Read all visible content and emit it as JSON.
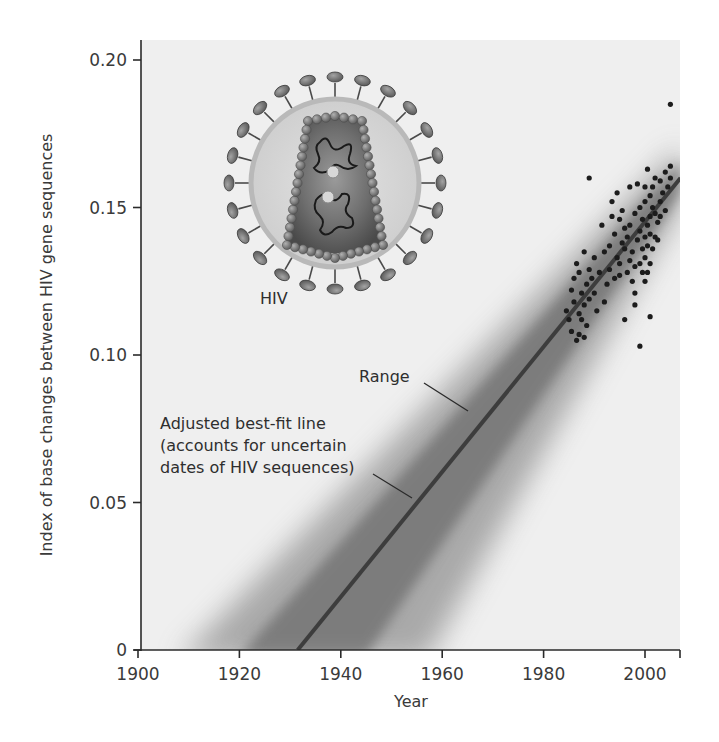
{
  "chart_data": {
    "type": "scatter",
    "title": "",
    "xlabel": "Year",
    "ylabel": "Index of base changes between HIV gene sequences",
    "xlim": [
      1900,
      2007
    ],
    "ylim": [
      0,
      0.21
    ],
    "x_ticks": [
      "1900",
      "1920",
      "1940",
      "1960",
      "1980",
      "2000"
    ],
    "y_ticks": [
      "0",
      "0.05",
      "0.10",
      "0.15",
      "0.20"
    ],
    "grid": false,
    "legend": null,
    "series": [
      {
        "name": "HIV sequences",
        "kind": "scatter",
        "color": "#1e1e1e",
        "points": [
          [
            1984.5,
            0.115
          ],
          [
            1985,
            0.112
          ],
          [
            1985.5,
            0.122
          ],
          [
            1985.5,
            0.108
          ],
          [
            1986,
            0.126
          ],
          [
            1986,
            0.118
          ],
          [
            1986.5,
            0.105
          ],
          [
            1986.5,
            0.131
          ],
          [
            1987,
            0.114
          ],
          [
            1987,
            0.107
          ],
          [
            1987,
            0.128
          ],
          [
            1987.5,
            0.121
          ],
          [
            1987.5,
            0.112
          ],
          [
            1988,
            0.117
          ],
          [
            1988,
            0.135
          ],
          [
            1988,
            0.106
          ],
          [
            1988.5,
            0.124
          ],
          [
            1988.5,
            0.11
          ],
          [
            1989,
            0.119
          ],
          [
            1989,
            0.129
          ],
          [
            1989,
            0.16
          ],
          [
            1989.5,
            0.126
          ],
          [
            1990,
            0.121
          ],
          [
            1990,
            0.133
          ],
          [
            1990.5,
            0.115
          ],
          [
            1991,
            0.128
          ],
          [
            1991.5,
            0.144
          ],
          [
            1992,
            0.118
          ],
          [
            1992,
            0.135
          ],
          [
            1992.5,
            0.124
          ],
          [
            1993,
            0.129
          ],
          [
            1993,
            0.137
          ],
          [
            1993.5,
            0.147
          ],
          [
            1993.5,
            0.152
          ],
          [
            1994,
            0.126
          ],
          [
            1994,
            0.141
          ],
          [
            1994.5,
            0.133
          ],
          [
            1994.5,
            0.155
          ],
          [
            1995,
            0.131
          ],
          [
            1995,
            0.127
          ],
          [
            1995,
            0.146
          ],
          [
            1995.5,
            0.138
          ],
          [
            1995.5,
            0.149
          ],
          [
            1996,
            0.136
          ],
          [
            1996,
            0.143
          ],
          [
            1996,
            0.112
          ],
          [
            1996.5,
            0.128
          ],
          [
            1996.5,
            0.14
          ],
          [
            1997,
            0.132
          ],
          [
            1997,
            0.144
          ],
          [
            1997,
            0.157
          ],
          [
            1997.5,
            0.125
          ],
          [
            1997.5,
            0.135
          ],
          [
            1998,
            0.13
          ],
          [
            1998,
            0.121
          ],
          [
            1998,
            0.148
          ],
          [
            1998,
            0.117
          ],
          [
            1998.5,
            0.139
          ],
          [
            1998.5,
            0.158
          ],
          [
            1999,
            0.131
          ],
          [
            1999,
            0.142
          ],
          [
            1999,
            0.15
          ],
          [
            1999,
            0.103
          ],
          [
            1999.5,
            0.128
          ],
          [
            1999.5,
            0.136
          ],
          [
            1999.5,
            0.146
          ],
          [
            2000,
            0.133
          ],
          [
            2000,
            0.14
          ],
          [
            2000,
            0.152
          ],
          [
            2000,
            0.157
          ],
          [
            2000,
            0.125
          ],
          [
            2000.5,
            0.128
          ],
          [
            2000.5,
            0.137
          ],
          [
            2000.5,
            0.144
          ],
          [
            2000.5,
            0.163
          ],
          [
            2001,
            0.131
          ],
          [
            2001,
            0.141
          ],
          [
            2001,
            0.147
          ],
          [
            2001,
            0.154
          ],
          [
            2001,
            0.113
          ],
          [
            2001.5,
            0.136
          ],
          [
            2001.5,
            0.15
          ],
          [
            2001.5,
            0.157
          ],
          [
            2002,
            0.14
          ],
          [
            2002,
            0.148
          ],
          [
            2002,
            0.16
          ],
          [
            2002.5,
            0.145
          ],
          [
            2002.5,
            0.139
          ],
          [
            2003,
            0.152
          ],
          [
            2003,
            0.159
          ],
          [
            2003,
            0.147
          ],
          [
            2003.5,
            0.155
          ],
          [
            2004,
            0.149
          ],
          [
            2004,
            0.162
          ],
          [
            2004.5,
            0.157
          ],
          [
            2005,
            0.164
          ],
          [
            2005,
            0.16
          ],
          [
            2005,
            0.185
          ]
        ]
      },
      {
        "name": "Adjusted best-fit line",
        "kind": "line",
        "color": "#3a3a3a",
        "x": [
          1931.5,
          2007
        ],
        "y": [
          0.0,
          0.16
        ]
      },
      {
        "name": "Range",
        "kind": "band",
        "color": "#7a7a7a",
        "description": "Shaded uncertainty band around best-fit line, widening toward earlier years (~1910 to ~1955 at y=0)"
      }
    ],
    "annotations": [
      {
        "text": "HIV",
        "target": "HIV virion illustration"
      },
      {
        "text": "Range",
        "target": "shaded band"
      },
      {
        "text": "Adjusted best-fit line\n(accounts for uncertain\ndates of HIV sequences)",
        "target": "best-fit line"
      }
    ]
  },
  "labels": {
    "xlabel": "Year",
    "ylabel": "Index of base changes between HIV gene sequences",
    "x_ticks": [
      {
        "label": "1900",
        "value": 1900
      },
      {
        "label": "1920",
        "value": 1920
      },
      {
        "label": "1940",
        "value": 1940
      },
      {
        "label": "1960",
        "value": 1960
      },
      {
        "label": "1980",
        "value": 1980
      },
      {
        "label": "2000",
        "value": 2000
      }
    ],
    "y_ticks": [
      {
        "label": "0",
        "value": 0
      },
      {
        "label": "0.05",
        "value": 0.05
      },
      {
        "label": "0.10",
        "value": 0.1
      },
      {
        "label": "0.15",
        "value": 0.15
      },
      {
        "label": "0.20",
        "value": 0.2
      }
    ],
    "hiv": "HIV",
    "range": "Range",
    "bestfit": [
      "Adjusted best-fit line",
      "(accounts for uncertain",
      "dates of HIV sequences)"
    ]
  },
  "colors": {
    "plot_bg": "#efefef",
    "axis": "#2a2a2a",
    "line": "#3d3d3d",
    "band": "#6f6f6f",
    "dots": "#1c1c1c",
    "virus_envelope": "#c4c4c4",
    "virus_capsid": "#6a6a6a",
    "virus_spike": "#7c7c7c"
  }
}
